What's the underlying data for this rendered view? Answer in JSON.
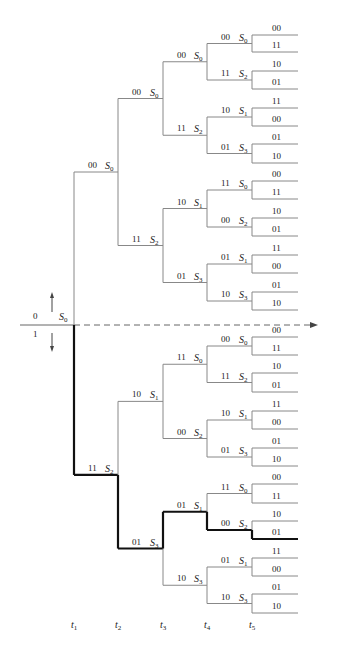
{
  "input_labels": {
    "zero": "0",
    "one": "1"
  },
  "root_state": "S0",
  "time_labels": [
    "t1",
    "t2",
    "t3",
    "t4",
    "t5"
  ],
  "tree": {
    "state": "S0",
    "children": [
      {
        "bits": "00",
        "state": "S0",
        "children": [
          {
            "bits": "00",
            "state": "S0",
            "children": [
              {
                "bits": "00",
                "state": "S0",
                "children": [
                  {
                    "bits": "00",
                    "state": "S0",
                    "leaves": [
                      "00",
                      "11"
                    ]
                  },
                  {
                    "bits": "11",
                    "state": "S2",
                    "leaves": [
                      "10",
                      "01"
                    ]
                  }
                ]
              },
              {
                "bits": "11",
                "state": "S2",
                "children": [
                  {
                    "bits": "10",
                    "state": "S1",
                    "leaves": [
                      "11",
                      "00"
                    ]
                  },
                  {
                    "bits": "01",
                    "state": "S3",
                    "leaves": [
                      "01",
                      "10"
                    ]
                  }
                ]
              }
            ]
          },
          {
            "bits": "11",
            "state": "S2",
            "children": [
              {
                "bits": "10",
                "state": "S1",
                "children": [
                  {
                    "bits": "11",
                    "state": "S0",
                    "leaves": [
                      "00",
                      "11"
                    ]
                  },
                  {
                    "bits": "00",
                    "state": "S2",
                    "leaves": [
                      "10",
                      "01"
                    ]
                  }
                ]
              },
              {
                "bits": "01",
                "state": "S3",
                "children": [
                  {
                    "bits": "01",
                    "state": "S1",
                    "leaves": [
                      "11",
                      "00"
                    ]
                  },
                  {
                    "bits": "10",
                    "state": "S3",
                    "leaves": [
                      "01",
                      "10"
                    ]
                  }
                ]
              }
            ]
          }
        ]
      },
      {
        "bits": "11",
        "state": "S2",
        "children": [
          {
            "bits": "10",
            "state": "S1",
            "children": [
              {
                "bits": "11",
                "state": "S0",
                "children": [
                  {
                    "bits": "00",
                    "state": "S0",
                    "leaves": [
                      "00",
                      "11"
                    ]
                  },
                  {
                    "bits": "11",
                    "state": "S2",
                    "leaves": [
                      "10",
                      "01"
                    ]
                  }
                ]
              },
              {
                "bits": "00",
                "state": "S2",
                "children": [
                  {
                    "bits": "10",
                    "state": "S1",
                    "leaves": [
                      "11",
                      "00"
                    ]
                  },
                  {
                    "bits": "01",
                    "state": "S3",
                    "leaves": [
                      "01",
                      "10"
                    ]
                  }
                ]
              }
            ]
          },
          {
            "bits": "01",
            "state": "S3",
            "children": [
              {
                "bits": "01",
                "state": "S1",
                "children": [
                  {
                    "bits": "11",
                    "state": "S0",
                    "leaves": [
                      "00",
                      "11"
                    ]
                  },
                  {
                    "bits": "00",
                    "state": "S2",
                    "leaves": [
                      "10",
                      "01"
                    ]
                  }
                ]
              },
              {
                "bits": "10",
                "state": "S3",
                "children": [
                  {
                    "bits": "01",
                    "state": "S1",
                    "leaves": [
                      "11",
                      "00"
                    ]
                  },
                  {
                    "bits": "10",
                    "state": "S3",
                    "leaves": [
                      "01",
                      "10"
                    ]
                  }
                ]
              }
            ]
          }
        ]
      }
    ]
  },
  "highlighted_path": [
    1,
    1,
    0,
    1,
    1
  ],
  "colors": {
    "branch": "#888888",
    "highlight": "#111111",
    "text": "#222222"
  }
}
